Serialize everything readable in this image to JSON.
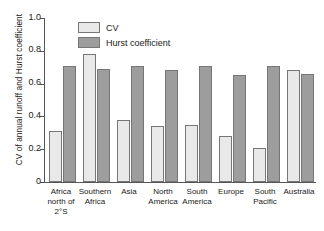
{
  "chart_data": {
    "type": "bar",
    "title": "",
    "xlabel": "",
    "ylabel": "CV of annual runoff and Hurst coefficient",
    "ylim": [
      0,
      1.0
    ],
    "yticks": [
      "0",
      "0.2",
      "0.4",
      "0.6",
      "0.8",
      "1.0"
    ],
    "ytick_values": [
      0,
      0.2,
      0.4,
      0.6,
      0.8,
      1.0
    ],
    "grid": false,
    "legend_position": "upper-left-inside",
    "categories": [
      "Africa north of 2°S",
      "Southern Africa",
      "Asia",
      "North America",
      "South America",
      "Europe",
      "South Pacific",
      "Australia"
    ],
    "category_lines": [
      [
        "Africa",
        "north of",
        "2°S"
      ],
      [
        "Southern",
        "Africa"
      ],
      [
        "Asia"
      ],
      [
        "North",
        "America"
      ],
      [
        "South",
        "America"
      ],
      [
        "Europe"
      ],
      [
        "South",
        "Pacific"
      ],
      [
        "Australia"
      ]
    ],
    "series": [
      {
        "name": "CV",
        "color": "#e9e9e9",
        "values": [
          0.31,
          0.78,
          0.38,
          0.34,
          0.345,
          0.28,
          0.21,
          0.68
        ]
      },
      {
        "name": "Hurst coefficient",
        "color": "#9d9d9d",
        "values": [
          0.705,
          0.69,
          0.71,
          0.685,
          0.705,
          0.655,
          0.71,
          0.66
        ]
      }
    ]
  },
  "legend": {
    "items": [
      {
        "label": "CV",
        "swatch": "cv"
      },
      {
        "label": "Hurst coefficient",
        "swatch": "hurst"
      }
    ]
  }
}
